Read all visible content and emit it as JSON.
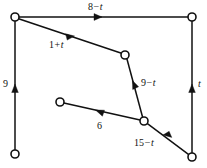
{
  "figure": {
    "type": "network-flow-diagram",
    "width": 207,
    "height": 168,
    "background_color": "#ffffff",
    "line_color": "#111111",
    "node_fill_color": "#ffffff"
  },
  "nodes": [
    {
      "id": "n-top-left",
      "name": "node-top-left",
      "x": 15,
      "y": 17,
      "r": 4
    },
    {
      "id": "n-top-right",
      "name": "node-top-right",
      "x": 192,
      "y": 17,
      "r": 4
    },
    {
      "id": "n-mid-upper",
      "name": "node-mid-upper",
      "x": 125,
      "y": 55,
      "r": 4
    },
    {
      "id": "n-mid-left",
      "name": "node-mid-left",
      "x": 60,
      "y": 102,
      "r": 4
    },
    {
      "id": "n-junction",
      "name": "node-junction",
      "x": 144,
      "y": 121,
      "r": 4
    },
    {
      "id": "n-bottom-left",
      "name": "node-bottom-left",
      "x": 15,
      "y": 154,
      "r": 4
    },
    {
      "id": "n-bottom-right",
      "name": "node-bottom-right",
      "x": 192,
      "y": 157,
      "r": 4
    }
  ],
  "edges": [
    {
      "id": "edge-top",
      "name": "edge-top-left-to-top-right",
      "from": "n-top-left",
      "to": "n-top-right",
      "direction": "right",
      "label": {
        "number": "8",
        "operator": "−",
        "variable": "t",
        "text": "8 − t"
      },
      "label_pos": {
        "x": 88,
        "y": 2
      }
    },
    {
      "id": "edge-diagonal-upper",
      "name": "edge-top-left-to-mid-upper",
      "from": "n-top-left",
      "to": "n-mid-upper",
      "direction": "down-right",
      "label": {
        "number": "1",
        "operator": "+",
        "variable": "t",
        "text": "1 + t"
      },
      "label_pos": {
        "x": 49,
        "y": 40
      }
    },
    {
      "id": "edge-left-vertical",
      "name": "edge-bottom-left-to-top-left",
      "from": "n-bottom-left",
      "to": "n-top-left",
      "direction": "up",
      "label": {
        "number": "9",
        "operator": "",
        "variable": "",
        "text": "9"
      },
      "label_pos": {
        "x": 3,
        "y": 79
      }
    },
    {
      "id": "edge-right-vertical",
      "name": "edge-bottom-right-to-top-right",
      "from": "n-bottom-right",
      "to": "n-top-right",
      "direction": "up",
      "label": {
        "number": "",
        "operator": "",
        "variable": "t",
        "text": "t"
      },
      "label_pos": {
        "x": 198,
        "y": 79
      }
    },
    {
      "id": "edge-junction-to-mid-upper",
      "name": "edge-junction-to-mid-upper",
      "from": "n-junction",
      "to": "n-mid-upper",
      "direction": "up",
      "label": {
        "number": "9",
        "operator": "−",
        "variable": "t",
        "text": "9 − t"
      },
      "label_pos": {
        "x": 141,
        "y": 78
      }
    },
    {
      "id": "edge-six",
      "name": "edge-junction-to-mid-left",
      "from": "n-junction",
      "to": "n-mid-left",
      "direction": "left",
      "label": {
        "number": "6",
        "operator": "",
        "variable": "",
        "text": "6"
      },
      "label_pos": {
        "x": 97,
        "y": 121
      }
    },
    {
      "id": "edge-fifteen",
      "name": "edge-bottom-right-to-junction",
      "from": "n-bottom-right",
      "to": "n-junction",
      "direction": "up-left",
      "label": {
        "number": "15",
        "operator": "−",
        "variable": "t",
        "text": "15 − t"
      },
      "label_pos": {
        "x": 134,
        "y": 138
      }
    }
  ]
}
